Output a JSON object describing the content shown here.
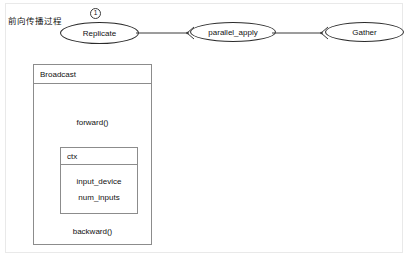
{
  "diagram": {
    "caption": "前向传播过程",
    "nodes": [
      {
        "id": "replicate",
        "label": "Replicate",
        "shape": "ellipse"
      },
      {
        "id": "parallel_apply",
        "label": "parallel_apply",
        "shape": "ellipse"
      },
      {
        "id": "gather",
        "label": "Gather",
        "shape": "ellipse"
      }
    ],
    "edges": [
      {
        "from": "replicate",
        "to": "parallel_apply",
        "arrow": "open"
      },
      {
        "from": "parallel_apply",
        "to": "gather",
        "arrow": "open"
      }
    ],
    "badges": {
      "replicate_step": "1",
      "forward_step": "1"
    },
    "broadcast_box": {
      "title": "Broadcast",
      "forward_method": "forward()",
      "backward_method": "backward()",
      "ctx_box": {
        "title": "ctx",
        "fields": [
          "input_device",
          "num_inputs"
        ]
      }
    },
    "colors": {
      "stroke": "#2b2b2b",
      "box_stroke": "#8c8c8c",
      "frame_stroke": "#e9e9e9",
      "background": "#ffffff",
      "text": "#111111"
    }
  }
}
